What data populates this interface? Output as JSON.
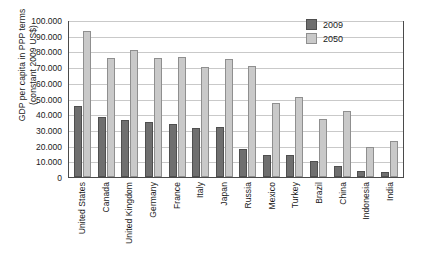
{
  "chart_data": {
    "type": "bar",
    "title": "",
    "xlabel": "",
    "ylabel": "GDP per capita in PPP terms (constant 2009 US$)",
    "ylabel_line1": "GDP per capita in PPP terms",
    "ylabel_line2": "(constant 2009 US$)",
    "ylim": [
      0,
      100000
    ],
    "ytick_step": 10000,
    "ytick_labels": [
      "0",
      "10.000",
      "20.000",
      "30.000",
      "40.000",
      "50.000",
      "60.000",
      "70.000",
      "80.000",
      "90.000",
      "100.000"
    ],
    "ytick_values": [
      0,
      10000,
      20000,
      30000,
      40000,
      50000,
      60000,
      70000,
      80000,
      90000,
      100000
    ],
    "grid": true,
    "legend_position": "top-right",
    "categories": [
      "United States",
      "Canada",
      "United Kingdom",
      "Germany",
      "France",
      "Italy",
      "Japan",
      "Russia",
      "Mexico",
      "Turkey",
      "Brazil",
      "China",
      "Indonesia",
      "India"
    ],
    "series": [
      {
        "name": "2009",
        "color": "#6f6f6f",
        "values": [
          45000,
          38000,
          36500,
          35000,
          33500,
          31000,
          32000,
          18000,
          14000,
          14000,
          10500,
          7000,
          4000,
          3000
        ]
      },
      {
        "name": "2050",
        "color": "#c9c9c9",
        "values": [
          93000,
          76000,
          81000,
          76000,
          76500,
          70000,
          75000,
          71000,
          47000,
          51000,
          37000,
          42000,
          19000,
          23000
        ]
      }
    ]
  }
}
